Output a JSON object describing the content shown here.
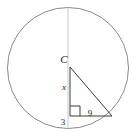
{
  "figure": {
    "kind": "geometry-diagram",
    "canvas": {
      "width": 140,
      "height": 137
    },
    "background_color": "#ffffff"
  },
  "circle": {
    "name": "main-circle",
    "center_x": 68,
    "center_y": 68,
    "radius": 60.5,
    "stroke_color": "#8a8a8a",
    "stroke_width": 1,
    "fill": "none"
  },
  "axis_line": {
    "name": "vertical-diameter",
    "x1": 68,
    "y1": 7.5,
    "x2": 68,
    "y2": 128.5,
    "stroke_color": "#c9c9c9",
    "stroke_width": 1
  },
  "triangle": {
    "name": "right-triangle",
    "stroke_color": "#3a3a3a",
    "stroke_width": 1,
    "fill": "none",
    "vertices": [
      {
        "name": "apex-center",
        "x": 70,
        "y": 67
      },
      {
        "name": "right-angle-corner",
        "x": 70,
        "y": 116
      },
      {
        "name": "chord-point",
        "x": 112,
        "y": 116
      }
    ]
  },
  "right_angle_marker": {
    "name": "right-angle-square",
    "x": 70,
    "y": 106,
    "size": 10,
    "stroke_color": "#3a3a3a",
    "stroke_width": 1
  },
  "labels": {
    "center": {
      "text": "C",
      "x": 64,
      "y": 63,
      "font_size": 11,
      "italic": true,
      "anchor": "middle"
    },
    "vertical_leg": {
      "text": "x",
      "x": 64,
      "y": 90,
      "font_size": 9,
      "italic": true,
      "anchor": "middle"
    },
    "horizontal_leg": {
      "text": "9",
      "x": 90,
      "y": 116,
      "font_size": 9,
      "italic": false,
      "anchor": "middle"
    },
    "below_corner": {
      "text": "3",
      "x": 63,
      "y": 125,
      "font_size": 9,
      "italic": false,
      "anchor": "middle"
    }
  }
}
